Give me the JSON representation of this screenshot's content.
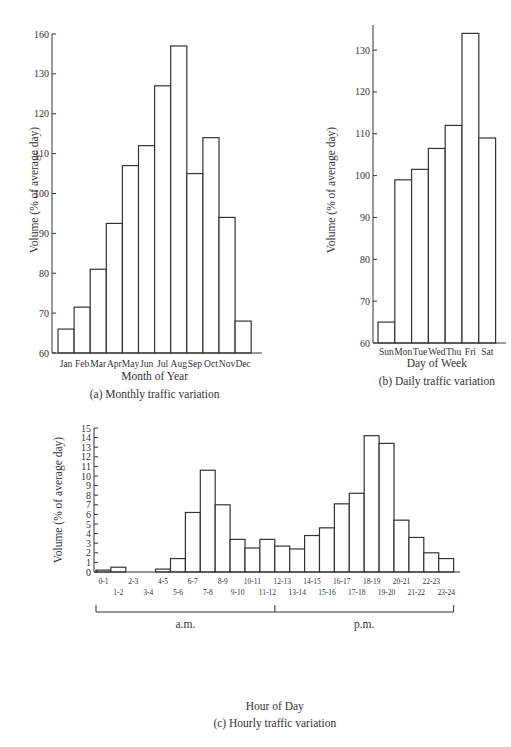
{
  "chart_data": [
    {
      "id": "monthly",
      "type": "bar",
      "title": "(a) Monthly traffic variation",
      "xlabel": "Month of Year",
      "ylabel": "Volume (% of average day)",
      "categories": [
        "Jan",
        "Feb",
        "Mar",
        "Apr",
        "May",
        "Jun",
        "Jul",
        "Aug",
        "Sep",
        "Oct",
        "Nov",
        "Dec"
      ],
      "values": [
        66,
        71.5,
        81,
        92.5,
        107,
        112,
        127,
        137,
        105,
        114,
        94,
        68
      ],
      "ylim": [
        60,
        140
      ],
      "yticks": [
        60,
        70,
        80,
        90,
        100,
        110,
        120,
        130,
        140
      ],
      "ytick_labels": [
        "60",
        "70",
        "80",
        "90",
        "100",
        "110",
        "120",
        "130",
        "160"
      ],
      "grid": false
    },
    {
      "id": "daily",
      "type": "bar",
      "title": "(b) Daily traffic variation",
      "xlabel": "Day of Week",
      "ylabel": "Volume (% of average day)",
      "categories": [
        "Sun",
        "Mon",
        "Tue",
        "Wed",
        "Thu",
        "Fri",
        "Sat"
      ],
      "values": [
        65,
        99,
        101.5,
        106.5,
        112,
        134,
        109
      ],
      "ylim": [
        60,
        136
      ],
      "yticks": [
        60,
        70,
        80,
        90,
        100,
        110,
        120,
        130
      ],
      "ytick_labels": [
        "60",
        "70",
        "80",
        "90",
        "100",
        "110",
        "120",
        "130"
      ],
      "grid": false
    },
    {
      "id": "hourly",
      "type": "bar",
      "title": "(c) Hourly traffic variation",
      "xlabel": "Hour of Day",
      "ylabel": "Volume (% of average day)",
      "categories": [
        "0-1",
        "1-2",
        "2-3",
        "3-4",
        "4-5",
        "5-6",
        "6-7",
        "7-8",
        "8-9",
        "9-10",
        "10-11",
        "11-12",
        "12-13",
        "13-14",
        "14-15",
        "15-16",
        "16-17",
        "17-18",
        "18-19",
        "19-20",
        "20-21",
        "21-22",
        "22-23",
        "23-24"
      ],
      "values": [
        0.2,
        0.5,
        0,
        0,
        0.3,
        1.4,
        6.2,
        10.6,
        7.0,
        3.4,
        2.5,
        3.4,
        2.7,
        2.4,
        3.8,
        4.6,
        7.1,
        8.2,
        14.2,
        13.4,
        5.4,
        3.6,
        2.0,
        1.4
      ],
      "ylim": [
        0,
        15
      ],
      "yticks": [
        0,
        1,
        2,
        3,
        4,
        5,
        6,
        7,
        8,
        9,
        10,
        11,
        12,
        13,
        14,
        15
      ],
      "ytick_labels": [
        "0",
        "1",
        "2",
        "3",
        "4",
        "5",
        "6",
        "7",
        "8",
        "9",
        "10",
        "11",
        "12",
        "13",
        "14",
        "15"
      ],
      "period_labels": [
        "a.m.",
        "p.m."
      ],
      "grid": false
    }
  ]
}
